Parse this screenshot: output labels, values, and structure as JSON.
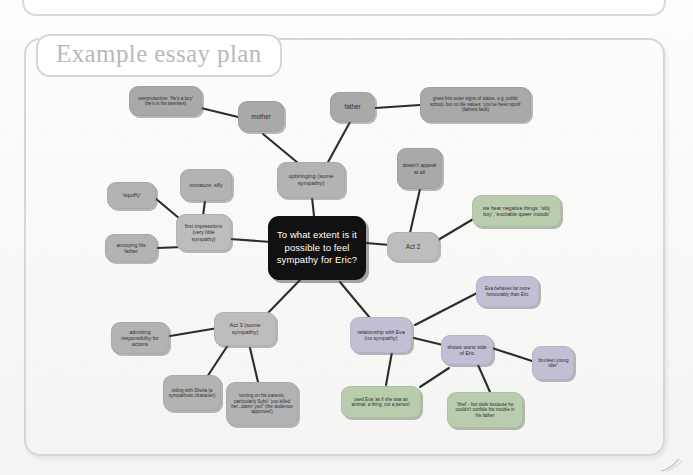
{
  "document": {
    "title": "Example essay plan",
    "background_color": "#f8f8f6",
    "frame_color": "#d6d6d6"
  },
  "mindmap": {
    "central_node": {
      "id": "center",
      "label": "To what extent is it possible to feel sympathy for Eric?",
      "color": "#111111",
      "text_color": "#ffffff"
    },
    "nodes": [
      {
        "id": "overprotective",
        "label": "overprotective: 'He's a boy' (he's in his twenties)",
        "color": "#a9a9a9"
      },
      {
        "id": "mother",
        "label": "mother",
        "color": "#a9a9a9"
      },
      {
        "id": "father",
        "label": "father",
        "color": "#a9a9a9"
      },
      {
        "id": "status",
        "label": "gives him outer signs of status, e.g. public school, but no life values: 'you've been spoilt' (fathers fault)",
        "color": "#a9a9a9"
      },
      {
        "id": "upbringing",
        "label": "upbringing (some sympathy)",
        "color": "#b3b3b3"
      },
      {
        "id": "doesnt-appear",
        "label": "doesn't appear at all",
        "color": "#a9a9a9"
      },
      {
        "id": "immature",
        "label": "immature, silly",
        "color": "#b3b3b3"
      },
      {
        "id": "squiffy",
        "label": "'squiffy'",
        "color": "#b3b3b3"
      },
      {
        "id": "annoying-father",
        "label": "annoying his father",
        "color": "#b3b3b3"
      },
      {
        "id": "first-impressions",
        "label": "first impressions (very little sympathy)",
        "color": "#bdbdbd"
      },
      {
        "id": "act2",
        "label": "Act 2",
        "color": "#bdbdbd"
      },
      {
        "id": "negative-things",
        "label": "we hear negative things: 'silly boy', 'excitable queer moods'",
        "color": "#b9ccad"
      },
      {
        "id": "act3",
        "label": "Act 3 (some sympathy)",
        "color": "#bdbdbd"
      },
      {
        "id": "admitting",
        "label": "admitting responsibility for actions",
        "color": "#b3b3b3"
      },
      {
        "id": "siding-sheila",
        "label": "siding with Sheila (a sympathetic character)",
        "color": "#b3b3b3"
      },
      {
        "id": "turning-parents",
        "label": "turning on his parents, particularly Sybil: 'you killed her...damn you!' (the audience approves!)",
        "color": "#b3b3b3"
      },
      {
        "id": "relationship-eva",
        "label": "relationship with Eva (no sympathy)",
        "color": "#c2bed4"
      },
      {
        "id": "eva-honourably",
        "label": "Eva behaves far more honourably than Eric",
        "color": "#c2bed4"
      },
      {
        "id": "worst-side",
        "label": "shows worst side of Eric",
        "color": "#c2bed4"
      },
      {
        "id": "used-eva",
        "label": "used Eva 'as if she was an animal, a thing, not a person'",
        "color": "#b9ccad"
      },
      {
        "id": "thief",
        "label": "'thief' - but stole because he couldn't confide his trouble in his father",
        "color": "#b9ccad"
      },
      {
        "id": "drunken-idler",
        "label": "'drunken young idler'",
        "color": "#c2bed4"
      }
    ]
  }
}
